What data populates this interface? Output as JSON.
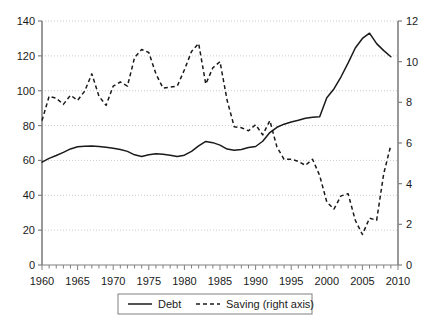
{
  "chart_data": {
    "type": "line",
    "title": "",
    "xlabel": "",
    "ylabel": "",
    "grid": true,
    "legend_position": "bottom",
    "x": [
      1960,
      1961,
      1962,
      1963,
      1964,
      1965,
      1966,
      1967,
      1968,
      1969,
      1970,
      1971,
      1972,
      1973,
      1974,
      1975,
      1976,
      1977,
      1978,
      1979,
      1980,
      1981,
      1982,
      1983,
      1984,
      1985,
      1986,
      1987,
      1988,
      1989,
      1990,
      1991,
      1992,
      1993,
      1994,
      1995,
      1996,
      1997,
      1998,
      1999,
      2000,
      2001,
      2002,
      2003,
      2004,
      2005,
      2006,
      2007,
      2008,
      2009
    ],
    "xlim": [
      1960,
      2010
    ],
    "x_tick_labels": [
      "1960",
      "1965",
      "1970",
      "1975",
      "1980",
      "1985",
      "1990",
      "1995",
      "2000",
      "2005",
      "2010"
    ],
    "x_tick_values": [
      1960,
      1965,
      1970,
      1975,
      1980,
      1985,
      1990,
      1995,
      2000,
      2005,
      2010
    ],
    "x_minor_tick_step": 1,
    "left_axis": {
      "ylim": [
        0,
        140
      ],
      "ticks": [
        0,
        20,
        40,
        60,
        80,
        100,
        120,
        140
      ],
      "tick_labels": [
        "0",
        "20",
        "40",
        "60",
        "80",
        "100",
        "120",
        "140"
      ]
    },
    "right_axis": {
      "ylim": [
        0,
        12
      ],
      "ticks": [
        0,
        2,
        4,
        6,
        8,
        10,
        12
      ],
      "tick_labels": [
        "0",
        "2",
        "4",
        "6",
        "8",
        "10",
        "12"
      ]
    },
    "series": [
      {
        "name": "Debt",
        "axis": "left",
        "style": "solid",
        "color": "#1a1a1a",
        "values": [
          59.0,
          61.0,
          62.6,
          64.2,
          66.0,
          67.6,
          68.1,
          68.3,
          68.0,
          67.7,
          67.2,
          66.6,
          65.8,
          64.3,
          62.4,
          62.9,
          63.7,
          63.6,
          63.2,
          62.2,
          62.3,
          63.4,
          65.5,
          68.5,
          70.9,
          70.2,
          68.3,
          66.2,
          65.8,
          67.2,
          67.6,
          72.5,
          77.0,
          79.4,
          81.2,
          82.1,
          83.2,
          84.2,
          85.1,
          85.3,
          84.6,
          86.3,
          88.0,
          89.6,
          91.2,
          91.6,
          94.0,
          96.2,
          101.0,
          108.0
        ]
      },
      {
        "name": "Saving (right axis)",
        "axis": "right",
        "style": "dashed",
        "color": "#1a1a1a",
        "values": [
          7.1,
          8.4,
          8.1,
          7.7,
          8.3,
          8.1,
          8.6,
          8.5,
          8.0,
          8.6,
          8.6,
          8.1,
          8.0,
          8.7,
          9.4,
          8.1,
          8.3,
          9.5,
          10.2,
          10.6,
          10.3,
          10.0,
          8.9,
          8.4,
          8.7,
          9.1,
          9.4,
          10.9,
          9.6,
          8.7,
          10.0,
          9.9,
          8.7,
          7.6,
          6.8,
          7.0,
          6.6,
          6.9,
          6.6,
          7.1,
          6.8,
          7.0,
          7.1,
          7.2,
          6.4,
          5.9,
          5.1,
          5.3,
          5.1,
          5.3
        ]
      }
    ],
    "legend": [
      {
        "label": "Debt",
        "style": "solid"
      },
      {
        "label": "Saving (right axis)",
        "style": "dashed"
      }
    ]
  },
  "series_points": {
    "debt": [
      [
        1960,
        59.0
      ],
      [
        1961,
        61.2
      ],
      [
        1962,
        62.8
      ],
      [
        1963,
        64.6
      ],
      [
        1964,
        66.6
      ],
      [
        1965,
        67.8
      ],
      [
        1966,
        68.2
      ],
      [
        1967,
        68.3
      ],
      [
        1968,
        68.0
      ],
      [
        1969,
        67.5
      ],
      [
        1970,
        67.0
      ],
      [
        1971,
        66.3
      ],
      [
        1972,
        65.2
      ],
      [
        1973,
        63.2
      ],
      [
        1974,
        62.2
      ],
      [
        1975,
        63.3
      ],
      [
        1976,
        63.8
      ],
      [
        1977,
        63.6
      ],
      [
        1978,
        63.0
      ],
      [
        1979,
        62.2
      ],
      [
        1980,
        63.0
      ],
      [
        1981,
        65.2
      ],
      [
        1982,
        68.3
      ],
      [
        1983,
        70.9
      ],
      [
        1984,
        70.2
      ],
      [
        1985,
        68.8
      ],
      [
        1986,
        66.5
      ],
      [
        1987,
        65.8
      ],
      [
        1988,
        66.3
      ],
      [
        1989,
        67.4
      ],
      [
        1990,
        68.0
      ],
      [
        1991,
        71.0
      ],
      [
        1992,
        76.0
      ],
      [
        1993,
        79.0
      ],
      [
        1994,
        80.8
      ],
      [
        1995,
        82.0
      ],
      [
        1996,
        83.0
      ],
      [
        1997,
        84.2
      ],
      [
        1998,
        84.8
      ],
      [
        1999,
        85.0
      ],
      [
        2000,
        84.5
      ],
      [
        2001,
        86.0
      ],
      [
        2002,
        88.0
      ],
      [
        2003,
        89.5
      ],
      [
        2004,
        91.0
      ],
      [
        2005,
        91.5
      ],
      [
        2006,
        93.8
      ],
      [
        2007,
        96.0
      ],
      [
        2008,
        100.5
      ],
      [
        2009,
        108.0
      ]
    ],
    "debt_peak": {
      "year": 2006,
      "value": 133
    },
    "saving_peak": {
      "year": 1982,
      "value": 10.9
    },
    "saving_min": {
      "year": 2005,
      "value": 1.5
    }
  },
  "axis_colors": {
    "axis_line": "#808080",
    "grid": "#cccccc",
    "series": "#1a1a1a",
    "text": "#1a1a1a",
    "legend_border": "#808080"
  }
}
